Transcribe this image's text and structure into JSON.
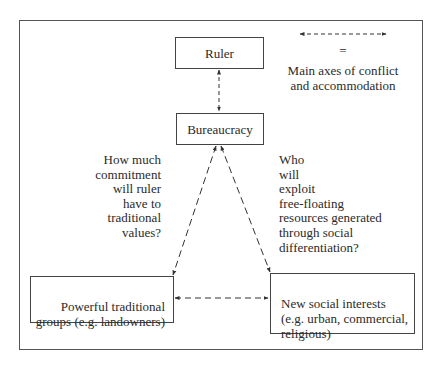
{
  "diagram": {
    "nodes": {
      "ruler": {
        "label": "Ruler"
      },
      "bureaucracy": {
        "label": "Bureaucracy"
      },
      "traditional_groups": {
        "label": "Powerful traditional\ngroups (e.g. landowners)"
      },
      "new_interests": {
        "label": "New social interests\n(e.g. urban, commercial,\nreligious)"
      }
    },
    "questions": {
      "left": "How much\ncommitment\nwill ruler\nhave to\ntraditional\nvalues?",
      "right": "Who\nwill\nexploit\nfree-floating\nresources generated\nthrough social\ndifferentiation?"
    },
    "legend": {
      "symbol": "dashed-double-arrow",
      "equals": "=",
      "meaning": "Main axes of conflict\nand accommodation"
    },
    "edges": [
      {
        "from": "Ruler",
        "to": "Bureaucracy",
        "style": "dashed",
        "arrows": "both"
      },
      {
        "from": "Bureaucracy",
        "to": "Powerful traditional groups",
        "style": "dashed",
        "arrows": "both"
      },
      {
        "from": "Bureaucracy",
        "to": "New social interests",
        "style": "dashed",
        "arrows": "both"
      },
      {
        "from": "Powerful traditional groups",
        "to": "New social interests",
        "style": "dashed",
        "arrows": "both"
      }
    ]
  }
}
